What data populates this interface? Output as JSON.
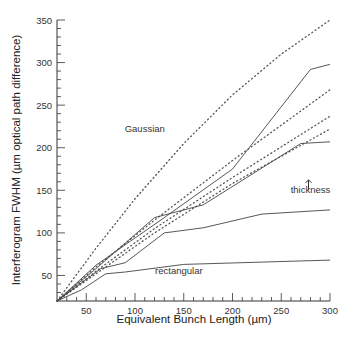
{
  "chart_data": {
    "type": "line",
    "title": "",
    "xlabel": "Equivalent Bunch Length (µm)",
    "ylabel": "Interferogram FWHM (µm optical path difference)",
    "xlim": [
      20,
      300
    ],
    "ylim": [
      20,
      350
    ],
    "xticks": [
      50,
      100,
      150,
      200,
      250,
      300
    ],
    "yticks": [
      50,
      100,
      150,
      200,
      250,
      300,
      350
    ],
    "grid": false,
    "legend": null,
    "annotations": [
      {
        "text": "Gaussian",
        "x": 110,
        "y": 218
      },
      {
        "text": "rectangular",
        "x": 145,
        "y": 52
      },
      {
        "text": "thickness",
        "x": 280,
        "y": 147,
        "arrow": "up"
      }
    ],
    "series": [
      {
        "name": "gaussian-dotted-1",
        "style": "dotted",
        "x": [
          20,
          60,
          100,
          150,
          200,
          250,
          300
        ],
        "y": [
          20,
          82,
          140,
          205,
          262,
          310,
          350
        ]
      },
      {
        "name": "solid-1",
        "style": "solid",
        "x": [
          20,
          60,
          130,
          200,
          280,
          300
        ],
        "y": [
          20,
          62,
          118,
          175,
          292,
          298
        ]
      },
      {
        "name": "dotted-2",
        "style": "dotted",
        "x": [
          20,
          60,
          120,
          200,
          300
        ],
        "y": [
          20,
          60,
          115,
          185,
          268
        ]
      },
      {
        "name": "dotted-3",
        "style": "dotted",
        "x": [
          20,
          60,
          120,
          200,
          300
        ],
        "y": [
          20,
          55,
          105,
          165,
          237
        ]
      },
      {
        "name": "dotted-4",
        "style": "dotted",
        "x": [
          20,
          60,
          120,
          200,
          300
        ],
        "y": [
          20,
          52,
          100,
          158,
          222
        ]
      },
      {
        "name": "solid-2",
        "style": "solid",
        "x": [
          20,
          60,
          120,
          170,
          270,
          300
        ],
        "y": [
          20,
          58,
          118,
          133,
          205,
          207
        ]
      },
      {
        "name": "solid-3",
        "style": "solid",
        "x": [
          20,
          65,
          90,
          130,
          170,
          230,
          300
        ],
        "y": [
          20,
          58,
          65,
          100,
          106,
          122,
          127
        ]
      },
      {
        "name": "rectangular",
        "style": "solid",
        "x": [
          20,
          45,
          70,
          90,
          150,
          300
        ],
        "y": [
          20,
          33,
          52,
          54,
          63,
          68
        ]
      }
    ]
  }
}
